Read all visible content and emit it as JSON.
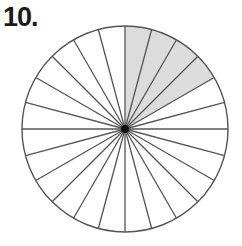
{
  "problem": {
    "number_label": "10."
  },
  "diagram": {
    "type": "circle-fraction",
    "center": [
      125,
      129
    ],
    "radius": 103,
    "total_sectors": 24,
    "shaded_sectors": 4,
    "shaded_start_deg_from_top_clockwise": 0,
    "shade_color": "#dcdcdc",
    "line_color": "#555555",
    "fraction_shaded": "4/24"
  }
}
